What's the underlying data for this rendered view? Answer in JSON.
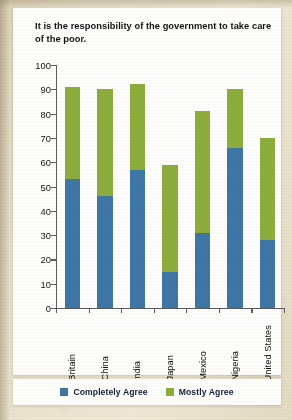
{
  "chart_data": {
    "type": "bar",
    "title": "It is the responsibility of the government to take care of the poor.",
    "xlabel": "",
    "ylabel": "",
    "ylim": [
      0,
      100
    ],
    "yticks": [
      0,
      10,
      20,
      30,
      40,
      50,
      60,
      70,
      80,
      90,
      100
    ],
    "grid": false,
    "stacked": true,
    "legend_position": "bottom",
    "categories": [
      "Britain",
      "China",
      "India",
      "Japan",
      "Mexico",
      "Nigeria",
      "United States"
    ],
    "series": [
      {
        "name": "Completely Agree",
        "color": "#3E77A6",
        "values": [
          53,
          46,
          57,
          15,
          31,
          66,
          28
        ]
      },
      {
        "name": "Mostly Agree",
        "color": "#8CAD3C",
        "values": [
          38,
          44,
          35,
          44,
          50,
          24,
          42
        ]
      }
    ],
    "totals": [
      91,
      90,
      92,
      59,
      81,
      90,
      70
    ]
  },
  "legend": {
    "items": [
      {
        "label": "Completely Agree",
        "color": "#3E77A6"
      },
      {
        "label": "Mostly Agree",
        "color": "#8CAD3C"
      }
    ]
  }
}
